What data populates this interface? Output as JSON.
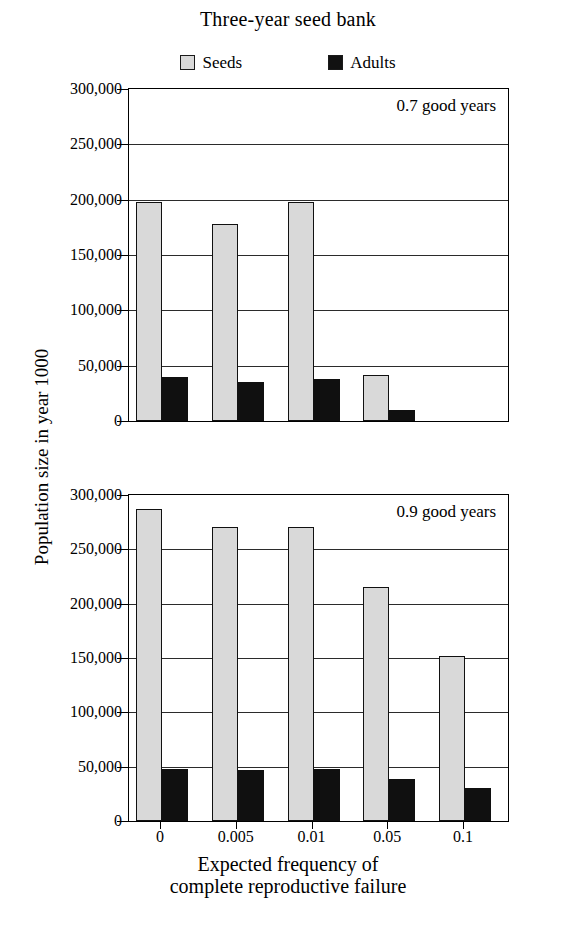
{
  "title": "Three-year seed bank",
  "legend": {
    "position": "top-center",
    "entries": [
      {
        "label": "Seeds",
        "color": "#d9d9d9",
        "swatch": "seeds-swatch"
      },
      {
        "label": "Adults",
        "color": "#101010",
        "swatch": "adults-swatch"
      }
    ]
  },
  "axes": {
    "ylabel": "Population size in year 1000",
    "xlabel_line1": "Expected frequency of",
    "xlabel_line2": "complete reproductive failure",
    "ytick_labels": [
      "300,000",
      "250,000",
      "200,000",
      "150,000",
      "100,000",
      "50,000",
      "0"
    ],
    "ytick_values": [
      300000,
      250000,
      200000,
      150000,
      100000,
      50000,
      0
    ],
    "xtick_labels": [
      "0",
      "0.005",
      "0.01",
      "0.05",
      "0.1"
    ]
  },
  "panels": [
    {
      "id": "top",
      "annotation": "0.7 good years"
    },
    {
      "id": "bottom",
      "annotation": "0.9 good years"
    }
  ],
  "chart_data": [
    {
      "type": "bar",
      "title": "Three-year seed bank",
      "panel": "0.7 good years",
      "xlabel": "Expected frequency of complete reproductive failure",
      "ylabel": "Population size in year 1000",
      "categories": [
        "0",
        "0.005",
        "0.01",
        "0.05",
        "0.1"
      ],
      "series": [
        {
          "name": "Seeds",
          "color": "#d9d9d9",
          "values": [
            198000,
            178000,
            198000,
            42000,
            0
          ]
        },
        {
          "name": "Adults",
          "color": "#101010",
          "values": [
            40000,
            35000,
            38000,
            10000,
            0
          ]
        }
      ],
      "ylim": [
        0,
        300000
      ],
      "yticks": [
        0,
        50000,
        100000,
        150000,
        200000,
        250000,
        300000
      ],
      "grid": true,
      "legend_position": "top-center"
    },
    {
      "type": "bar",
      "title": "Three-year seed bank",
      "panel": "0.9 good years",
      "xlabel": "Expected frequency of complete reproductive failure",
      "ylabel": "Population size in year 1000",
      "categories": [
        "0",
        "0.005",
        "0.01",
        "0.05",
        "0.1"
      ],
      "series": [
        {
          "name": "Seeds",
          "color": "#d9d9d9",
          "values": [
            287000,
            271000,
            271000,
            215000,
            152000
          ]
        },
        {
          "name": "Adults",
          "color": "#101010",
          "values": [
            48000,
            47000,
            48000,
            39000,
            30000
          ]
        }
      ],
      "ylim": [
        0,
        300000
      ],
      "yticks": [
        0,
        50000,
        100000,
        150000,
        200000,
        250000,
        300000
      ],
      "grid": true,
      "legend_position": "top-center"
    }
  ]
}
